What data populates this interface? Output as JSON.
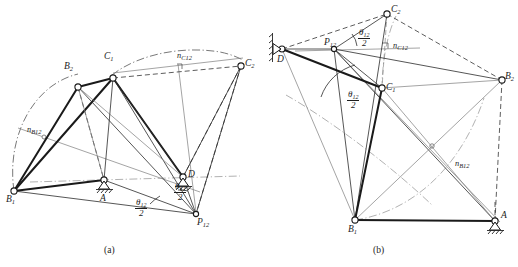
{
  "figure": {
    "panels": [
      {
        "id": "a",
        "caption": "(a)",
        "nodes": [
          {
            "name": "B1",
            "label": "B",
            "sub": "1"
          },
          {
            "name": "B2",
            "label": "B",
            "sub": "2"
          },
          {
            "name": "C1",
            "label": "C",
            "sub": "1"
          },
          {
            "name": "C2",
            "label": "C",
            "sub": "2"
          },
          {
            "name": "A",
            "label": "A",
            "sub": ""
          },
          {
            "name": "D",
            "label": "D",
            "sub": ""
          },
          {
            "name": "P12",
            "label": "P",
            "sub": "12"
          }
        ],
        "construction_labels": [
          {
            "name": "nB12",
            "label": "n",
            "sub": "B12"
          },
          {
            "name": "nC12",
            "label": "n",
            "sub": "C12"
          }
        ],
        "angle_labels": [
          {
            "name": "theta-half-bottom",
            "numerator": "θ",
            "sub": "12",
            "denominator": "2"
          },
          {
            "name": "theta-half-upper",
            "numerator": "θ",
            "sub": "12",
            "denominator": "2"
          }
        ]
      },
      {
        "id": "b",
        "caption": "(b)",
        "nodes": [
          {
            "name": "B1",
            "label": "B",
            "sub": "1"
          },
          {
            "name": "B2",
            "label": "B",
            "sub": "2"
          },
          {
            "name": "C1",
            "label": "C",
            "sub": "1"
          },
          {
            "name": "C2",
            "label": "C",
            "sub": "2"
          },
          {
            "name": "A",
            "label": "A",
            "sub": ""
          },
          {
            "name": "D",
            "label": "D",
            "sub": ""
          },
          {
            "name": "P12",
            "label": "P",
            "sub": "12"
          }
        ],
        "construction_labels": [
          {
            "name": "nB12",
            "label": "n",
            "sub": "B12"
          },
          {
            "name": "nC12",
            "label": "n",
            "sub": "C12"
          }
        ],
        "angle_labels": [
          {
            "name": "theta-half-top",
            "numerator": "θ",
            "sub": "12",
            "denominator": "2"
          },
          {
            "name": "theta-half-lower",
            "numerator": "θ",
            "sub": "12",
            "denominator": "2"
          }
        ]
      }
    ],
    "colors": {
      "ink": "#1c1c1c",
      "thick_link": "#1a1a1a",
      "grey_construction": "#8a8a8a",
      "background": "#ffffff"
    }
  }
}
